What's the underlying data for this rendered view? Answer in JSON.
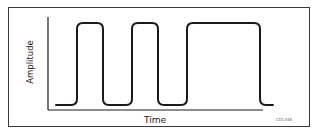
{
  "diagram": {
    "type": "pulse-waveform",
    "y_axis_label": "Amplitude",
    "x_axis_label": "Time",
    "figure_code": "CD1346",
    "colors": {
      "line": "#1a1a1a",
      "frame": "#3a3a3a",
      "background": "#ffffff"
    },
    "levels": {
      "low": 105,
      "high": 23
    },
    "pulses": [
      {
        "start_x": 77,
        "end_x": 103
      },
      {
        "start_x": 132,
        "end_x": 158
      },
      {
        "start_x": 187,
        "end_x": 260
      }
    ]
  }
}
